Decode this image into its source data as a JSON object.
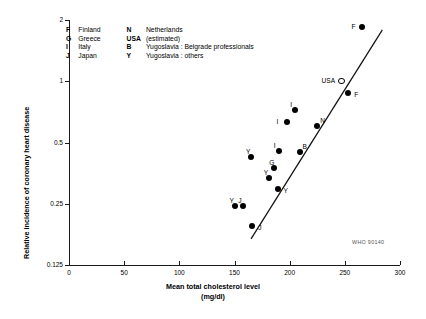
{
  "credit": "WHO 90140",
  "legend": {
    "rows": [
      {
        "key": "F",
        "name": "Finland",
        "key2": "N",
        "name2": "Netherlands"
      },
      {
        "key": "G",
        "name": "Greece",
        "key2": "USA",
        "name2": "(estimated)"
      },
      {
        "key": "I",
        "name": "Italy",
        "key2": "B",
        "name2": "Yugoslavia : Belgrade professionals"
      },
      {
        "key": "J",
        "name": "Japan",
        "key2": "Y",
        "name2": "Yugoslavia : others"
      }
    ]
  },
  "chart_data": {
    "type": "scatter",
    "title": "",
    "xlabel": "Mean total cholesterol level",
    "xlabel_units": "(mg/dl)",
    "ylabel": "Relative incidence of coronary heart disease",
    "xlim": [
      0,
      300
    ],
    "ylim": [
      0.125,
      2
    ],
    "yscale": "log",
    "xscale": "linear",
    "xticks": [
      0,
      50,
      100,
      150,
      200,
      250,
      300
    ],
    "xticklabels": [
      "0",
      "50",
      "100",
      "150",
      "200",
      "250",
      "300"
    ],
    "yticks": [
      0.125,
      0.25,
      0.5,
      1,
      2
    ],
    "yticklabels": [
      "0.125",
      "0.25",
      "0.5",
      "1",
      "2"
    ],
    "grid": false,
    "legend_position": "upper-left-inside",
    "trendline": {
      "x0": 165,
      "y0": 0.168,
      "x1": 284,
      "y1": 1.79
    },
    "points": [
      {
        "label": "F",
        "x": 266,
        "y": 1.85,
        "marker": "filled",
        "label_pos": "left"
      },
      {
        "label": "USA",
        "x": 247,
        "y": 1.0,
        "marker": "open",
        "label_pos": "left"
      },
      {
        "label": "F",
        "x": 253,
        "y": 0.88,
        "marker": "filled",
        "label_pos": "right"
      },
      {
        "label": "I",
        "x": 205,
        "y": 0.72,
        "marker": "filled",
        "label_pos": "topleft"
      },
      {
        "label": "I",
        "x": 198,
        "y": 0.63,
        "marker": "filled",
        "label_pos": "left"
      },
      {
        "label": "N",
        "x": 225,
        "y": 0.6,
        "marker": "filled",
        "label_pos": "topright"
      },
      {
        "label": "I",
        "x": 190,
        "y": 0.455,
        "marker": "filled",
        "label_pos": "topleft"
      },
      {
        "label": "B",
        "x": 209,
        "y": 0.45,
        "marker": "filled",
        "label_pos": "topright"
      },
      {
        "label": "Y",
        "x": 165,
        "y": 0.425,
        "marker": "filled",
        "label_pos": "topleft"
      },
      {
        "label": "G",
        "x": 186,
        "y": 0.375,
        "marker": "filled",
        "label_pos": "topleft"
      },
      {
        "label": "Y",
        "x": 181,
        "y": 0.335,
        "marker": "filled",
        "label_pos": "topleft"
      },
      {
        "label": "Y",
        "x": 189,
        "y": 0.295,
        "marker": "filled",
        "label_pos": "right"
      },
      {
        "label": "Y",
        "x": 150,
        "y": 0.245,
        "marker": "filled",
        "label_pos": "topleft"
      },
      {
        "label": "J",
        "x": 158,
        "y": 0.245,
        "marker": "filled",
        "label_pos": "topleft"
      },
      {
        "label": "J",
        "x": 166,
        "y": 0.195,
        "marker": "filled",
        "label_pos": "right"
      }
    ]
  }
}
